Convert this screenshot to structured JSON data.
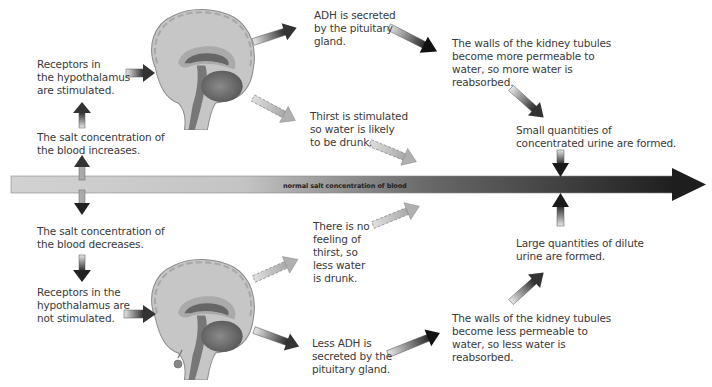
{
  "diagram": {
    "main_axis_label": "normal salt concentration of blood",
    "top_path": {
      "salt_increase": "The salt concentration of\nthe blood increases.",
      "receptors": "Receptors in\nthe hypothalamus\nare stimulated.",
      "adh": "ADH is secreted\nby the pituitary\ngland.",
      "thirst": "Thirst is stimulated\nso water is likely\nto be drunk.",
      "kidney": "The walls of the kidney tubules\nbecome more permeable to\nwater, so more water is\nreabsorbed.",
      "urine": "Small quantities of\nconcentrated urine are formed."
    },
    "bottom_path": {
      "salt_decrease": "The salt concentration of\nthe blood decreases.",
      "receptors": "Receptors in the\nhypothalamus are\nnot stimulated.",
      "no_thirst": "There is no\nfeeling of\nthirst, so\nless water\nis drunk.",
      "less_adh": "Less ADH is\nsecreted by the\npituitary gland.",
      "kidney": "The walls of the kidney tubules\nbecome less permeable to\nwater, so less water is\nreabsorbed.",
      "urine": "Large quantities of dilute\nurine are formed."
    },
    "colors": {
      "brain_light": "#c8c8c8",
      "brain_mid": "#9a9a9a",
      "brain_dark": "#5e5e5e",
      "arrow_dark": "#222222",
      "bar_light": "#cfcfcf",
      "bar_dark": "#2a2a2a"
    }
  }
}
